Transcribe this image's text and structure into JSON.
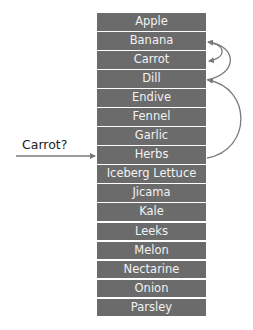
{
  "diagram": {
    "type": "binary-search-illustration",
    "query_label": "Carrot?",
    "items": [
      {
        "label": "Apple"
      },
      {
        "label": "Banana"
      },
      {
        "label": "Carrot"
      },
      {
        "label": "Dill"
      },
      {
        "label": "Endive"
      },
      {
        "label": "Fennel"
      },
      {
        "label": "Garlic"
      },
      {
        "label": "Herbs"
      },
      {
        "label": "Iceberg Lettuce"
      },
      {
        "label": "Jicama"
      },
      {
        "label": "Kale"
      },
      {
        "label": "Leeks"
      },
      {
        "label": "Melon"
      },
      {
        "label": "Nectarine"
      },
      {
        "label": "Onion"
      },
      {
        "label": "Parsley"
      }
    ],
    "entry_target": "Herbs",
    "jumps": [
      {
        "from": "Herbs",
        "to": "Dill"
      },
      {
        "from": "Dill",
        "to": "Banana"
      },
      {
        "from": "Banana",
        "to": "Carrot"
      }
    ],
    "colors": {
      "box_fill": "#6b6b6b",
      "box_text": "#f2f2f2",
      "arrow": "#7a7a7a",
      "label_text": "#222222",
      "background": "#ffffff"
    }
  }
}
